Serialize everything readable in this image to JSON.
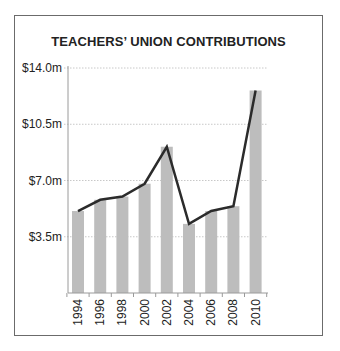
{
  "chart_data": {
    "type": "bar",
    "title": "TEACHERS’ UNION CONTRIBUTIONS",
    "xlabel": "",
    "ylabel": "",
    "categories": [
      "1994",
      "1996",
      "1998",
      "2000",
      "2002",
      "2004",
      "2006",
      "2008",
      "2010"
    ],
    "series": [
      {
        "name": "Contributions (bars)",
        "kind": "bar",
        "values": [
          5.1,
          5.8,
          6.0,
          6.8,
          9.1,
          4.3,
          5.1,
          5.4,
          12.6
        ]
      },
      {
        "name": "Contributions (line)",
        "kind": "line",
        "values": [
          5.1,
          5.8,
          6.0,
          6.8,
          9.1,
          4.3,
          5.1,
          5.4,
          12.6
        ]
      }
    ],
    "ylim": [
      0,
      14.0
    ],
    "yticks": [
      3.5,
      7.0,
      10.5,
      14.0
    ],
    "ytick_labels": [
      "$3.5m",
      "$7.0m",
      "$10.5m",
      "$14.0m"
    ],
    "grid": true,
    "legend": "none",
    "colors": {
      "bar": "#bdbdbd",
      "line": "#2b2b2b",
      "grid": "#c8c8c8",
      "axis": "#9a9a9a",
      "frame": "#6b6b6b"
    }
  }
}
